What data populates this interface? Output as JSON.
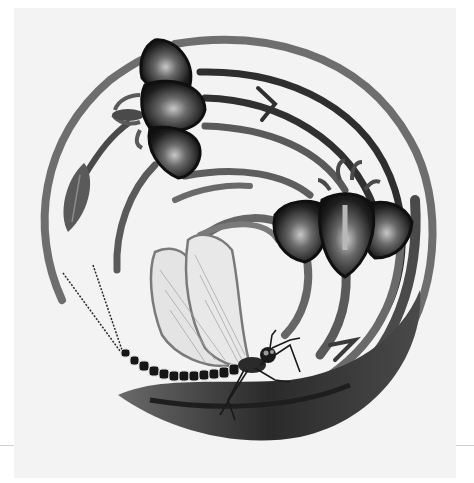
{
  "image": {
    "subject": "Monochrome embroidery: circular swirl of stems with two iris flowers and a dragonfly",
    "palette": {
      "background": "#ffffff",
      "fabric": "#f3f3f3",
      "stem_light": "#7a7a7a",
      "stem_mid": "#5a5a5a",
      "stem_dark": "#2e2e2e",
      "petal_dark": "#141414",
      "petal_highlight": "#b5b5b5",
      "wing_fill": "#e6e6e6",
      "wing_outline": "#8a8a8a",
      "bead": "#1a1a1a"
    }
  },
  "elements": {
    "flower_upper_left": {
      "label": "iris flower (upper left)"
    },
    "flower_right": {
      "label": "iris flower (right)"
    },
    "bud": {
      "label": "leaf bud"
    },
    "dragonfly": {
      "label": "dragonfly with beaded body"
    },
    "swirl": {
      "label": "concentric stem swirl"
    }
  }
}
